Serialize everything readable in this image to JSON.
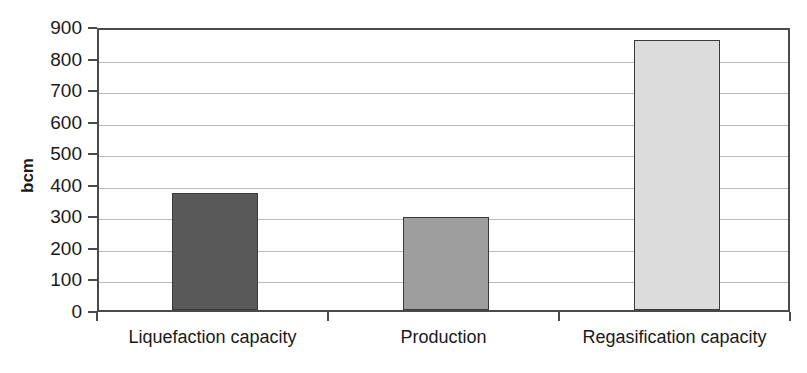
{
  "chart_data": {
    "type": "bar",
    "title": "",
    "subtitle": "",
    "xlabel": "",
    "ylabel": "bcm",
    "categories": [
      "Liquefaction capacity",
      "Production",
      "Regasification capacity"
    ],
    "values": [
      370,
      295,
      855
    ],
    "series": [
      {
        "name": "bcm",
        "values": [
          370,
          295,
          855
        ]
      }
    ],
    "ylim": [
      0,
      900
    ],
    "ytick_labels": [
      "0",
      "100",
      "200",
      "300",
      "400",
      "500",
      "600",
      "700",
      "800",
      "900"
    ],
    "ytick_values": [
      0,
      100,
      200,
      300,
      400,
      500,
      600,
      700,
      800,
      900
    ],
    "grid": true,
    "legend": "none",
    "bar_colors": [
      "#595959",
      "#9e9e9e",
      "#dcdcdc"
    ],
    "bar_edge_color": "#3a3a3a",
    "axis_color": "#4a4a4a",
    "gridline_color": "#b9b9b9",
    "background": "#ffffff",
    "annotations": []
  }
}
